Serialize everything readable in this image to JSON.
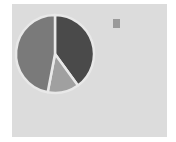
{
  "chart_data": {
    "type": "pie",
    "title": "",
    "slices": [
      {
        "label": "",
        "value": 40,
        "color": "#4a4a4a"
      },
      {
        "label": "",
        "value": 13,
        "color": "#a0a0a0"
      },
      {
        "label": "",
        "value": 47,
        "color": "#7a7a7a"
      }
    ],
    "start_angle_deg": 0,
    "direction": "clockwise",
    "legend": {
      "placement": "top-right",
      "entries": [
        ""
      ]
    },
    "background": "#dcdcdc",
    "separator_color": "#e8e8e8"
  }
}
